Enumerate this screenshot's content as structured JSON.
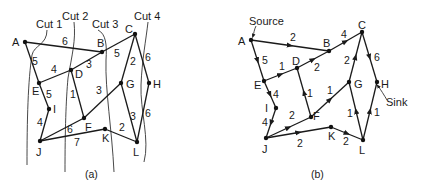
{
  "panel_a": {
    "caption": "(a)",
    "cuts": [
      {
        "label": "Cut 1"
      },
      {
        "label": "Cut 2"
      },
      {
        "label": "Cut 3"
      },
      {
        "label": "Cut 4"
      }
    ],
    "nodes": [
      "A",
      "B",
      "C",
      "D",
      "E",
      "F",
      "G",
      "H",
      "I",
      "J",
      "K",
      "L"
    ],
    "edges": [
      {
        "from": "A",
        "to": "B",
        "capacity": "6"
      },
      {
        "from": "A",
        "to": "E",
        "capacity": "5"
      },
      {
        "from": "B",
        "to": "C",
        "capacity": "5"
      },
      {
        "from": "D",
        "to": "B",
        "capacity": "3"
      },
      {
        "from": "E",
        "to": "D",
        "capacity": "4"
      },
      {
        "from": "E",
        "to": "I",
        "capacity": "5"
      },
      {
        "from": "D",
        "to": "F",
        "capacity": "1"
      },
      {
        "from": "F",
        "to": "G",
        "capacity": "3"
      },
      {
        "from": "C",
        "to": "G",
        "capacity": "2"
      },
      {
        "from": "C",
        "to": "H",
        "capacity": "6"
      },
      {
        "from": "I",
        "to": "J",
        "capacity": "4"
      },
      {
        "from": "J",
        "to": "F",
        "capacity": "6"
      },
      {
        "from": "J",
        "to": "K",
        "capacity": "7"
      },
      {
        "from": "K",
        "to": "L",
        "capacity": "2"
      },
      {
        "from": "G",
        "to": "L",
        "capacity": "3"
      },
      {
        "from": "L",
        "to": "H",
        "capacity": "6"
      }
    ]
  },
  "panel_b": {
    "caption": "(b)",
    "source_label": "Source",
    "sink_label": "Sink",
    "nodes": [
      "A",
      "B",
      "C",
      "D",
      "E",
      "F",
      "G",
      "H",
      "I",
      "J",
      "K",
      "L"
    ],
    "edges": [
      {
        "from": "A",
        "to": "B",
        "flow": "2"
      },
      {
        "from": "A",
        "to": "E",
        "flow": "5"
      },
      {
        "from": "B",
        "to": "C",
        "flow": "4"
      },
      {
        "from": "D",
        "to": "B",
        "flow": "2"
      },
      {
        "from": "E",
        "to": "D",
        "flow": "1"
      },
      {
        "from": "E",
        "to": "I",
        "flow": "4"
      },
      {
        "from": "D",
        "to": "F",
        "flow": "1"
      },
      {
        "from": "F",
        "to": "G",
        "flow": "1"
      },
      {
        "from": "G",
        "to": "C",
        "flow": "2"
      },
      {
        "from": "C",
        "to": "H",
        "flow": "6"
      },
      {
        "from": "I",
        "to": "J",
        "flow": "4"
      },
      {
        "from": "J",
        "to": "F",
        "flow": "2"
      },
      {
        "from": "J",
        "to": "K",
        "flow": "2"
      },
      {
        "from": "K",
        "to": "L",
        "flow": "2"
      },
      {
        "from": "L",
        "to": "G",
        "flow": "1"
      },
      {
        "from": "L",
        "to": "H",
        "flow": "1"
      }
    ]
  }
}
